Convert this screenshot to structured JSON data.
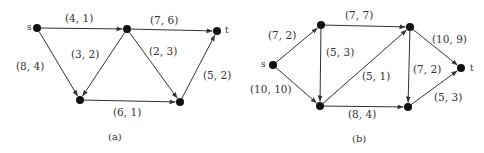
{
  "graphs": [
    {
      "id": "a",
      "caption": "(a)",
      "nodes": [
        {
          "id": "s",
          "label": "s",
          "x": 37,
          "y": 28,
          "lx": 27,
          "ly": 30
        },
        {
          "id": "a1",
          "label": "",
          "x": 127,
          "y": 29
        },
        {
          "id": "t",
          "label": "t",
          "x": 217,
          "y": 31,
          "lx": 225,
          "ly": 33
        },
        {
          "id": "b1",
          "label": "",
          "x": 80,
          "y": 100
        },
        {
          "id": "b2",
          "label": "",
          "x": 180,
          "y": 102
        }
      ],
      "edges": [
        {
          "from": "s",
          "to": "a1",
          "label": "(4, 1)",
          "lx": 65,
          "ly": 22
        },
        {
          "from": "a1",
          "to": "t",
          "label": "(7, 6)",
          "lx": 150,
          "ly": 24
        },
        {
          "from": "a1",
          "to": "b1",
          "label": "(3, 2)",
          "lx": 71,
          "ly": 58
        },
        {
          "from": "a1",
          "to": "b2",
          "label": "(2, 3)",
          "lx": 149,
          "ly": 55
        },
        {
          "from": "s",
          "to": "b1",
          "label": "(8, 4)",
          "lx": 16,
          "ly": 70
        },
        {
          "from": "b1",
          "to": "b2",
          "label": "(6, 1)",
          "lx": 113,
          "ly": 116
        },
        {
          "from": "b2",
          "to": "t",
          "label": "(5, 2)",
          "lx": 203,
          "ly": 79
        }
      ],
      "caption_pos": {
        "x": 108,
        "y": 140
      }
    },
    {
      "id": "b",
      "caption": "(b)",
      "nodes": [
        {
          "id": "s",
          "label": "s",
          "x": 273,
          "y": 65,
          "lx": 261,
          "ly": 67
        },
        {
          "id": "u1",
          "label": "",
          "x": 321,
          "y": 25
        },
        {
          "id": "u2",
          "label": "",
          "x": 410,
          "y": 27
        },
        {
          "id": "t",
          "label": "t",
          "x": 461,
          "y": 68,
          "lx": 470,
          "ly": 71
        },
        {
          "id": "v1",
          "label": "",
          "x": 320,
          "y": 106
        },
        {
          "id": "v2",
          "label": "",
          "x": 408,
          "y": 107
        }
      ],
      "edges": [
        {
          "from": "s",
          "to": "u1",
          "label": "(7, 2)",
          "lx": 268,
          "ly": 39
        },
        {
          "from": "s",
          "to": "v1",
          "label": "(10, 10)",
          "lx": 250,
          "ly": 93
        },
        {
          "from": "u1",
          "to": "u2",
          "label": "(7, 7)",
          "lx": 345,
          "ly": 19
        },
        {
          "from": "u1",
          "to": "v1",
          "label": "(5, 3)",
          "lx": 326,
          "ly": 56
        },
        {
          "from": "v1",
          "to": "u2",
          "label": "(5, 1)",
          "lx": 362,
          "ly": 80
        },
        {
          "from": "u2",
          "to": "v2",
          "label": "(7, 2)",
          "lx": 413,
          "ly": 73
        },
        {
          "from": "u2",
          "to": "t",
          "label": "(10, 9)",
          "lx": 432,
          "ly": 43
        },
        {
          "from": "v1",
          "to": "v2",
          "label": "(8, 4)",
          "lx": 348,
          "ly": 118
        },
        {
          "from": "v2",
          "to": "t",
          "label": "(5, 3)",
          "lx": 434,
          "ly": 101
        }
      ],
      "caption_pos": {
        "x": 352,
        "y": 142
      }
    }
  ]
}
